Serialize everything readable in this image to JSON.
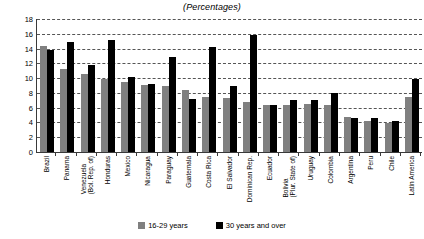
{
  "chart_data": {
    "type": "bar",
    "title": "(Percentages)",
    "xlabel": "",
    "ylabel": "",
    "ylim": [
      0,
      18
    ],
    "yticks": [
      0,
      2,
      4,
      6,
      8,
      10,
      12,
      14,
      16,
      18
    ],
    "grid": true,
    "legend_position": "bottom",
    "categories": [
      "Brazil",
      "Panama",
      "Venezuela\n(Bol. Rep. of)",
      "Honduras",
      "Mexico",
      "Nicaragua",
      "Paraguay",
      "Guatemala",
      "Costa Rica",
      "El Salvador",
      "Dominican Rep.",
      "Ecuador",
      "Bolivia\n(Plur. State of)",
      "Uruguay",
      "Colombia",
      "Argentina",
      "Peru",
      "Chile",
      "Latin America"
    ],
    "series": [
      {
        "name": "16-29 years",
        "color": "#808080",
        "values": [
          14.4,
          11.2,
          10.6,
          9.9,
          9.5,
          9.1,
          9.0,
          8.4,
          7.5,
          7.3,
          6.8,
          6.4,
          6.4,
          6.5,
          6.3,
          4.8,
          4.2,
          3.9,
          7.4
        ]
      },
      {
        "name": "30 years and over",
        "color": "#000000",
        "values": [
          13.8,
          14.9,
          11.8,
          15.1,
          10.2,
          9.2,
          12.9,
          7.2,
          14.2,
          9.0,
          15.9,
          6.4,
          7.0,
          7.0,
          8.0,
          4.6,
          4.6,
          4.2,
          9.9
        ]
      }
    ]
  },
  "legend": {
    "items": [
      {
        "label": "16-29 years"
      },
      {
        "label": "30 years and over"
      }
    ]
  },
  "colors": {
    "young": "#808080",
    "old": "#000000",
    "axis": "#3a3a3a",
    "grid": "#555555",
    "background": "#ffffff"
  }
}
